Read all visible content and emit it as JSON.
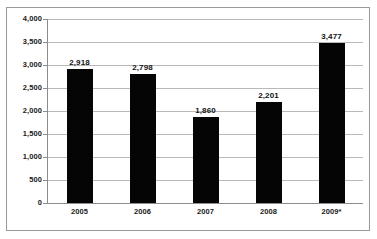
{
  "chart_data": {
    "type": "bar",
    "title": "",
    "subtitle": "",
    "xlabel": "",
    "ylabel": "",
    "categories": [
      "2005",
      "2006",
      "2007",
      "2008",
      "2009*"
    ],
    "values": [
      2918,
      2798,
      1860,
      2201,
      3477
    ],
    "data_labels": [
      "2,918",
      "2,798",
      "1,860",
      "2,201",
      "3,477"
    ],
    "ylim": [
      0,
      4000
    ],
    "y_tick_values": [
      4000,
      3500,
      3000,
      2500,
      2000,
      1500,
      1000,
      500,
      0
    ],
    "y_tick_labels": [
      "4,000",
      "3,500",
      "3,000",
      "2,500",
      "2,000",
      "1,500",
      "1,000",
      "500",
      "0"
    ],
    "grid": true,
    "legend": false,
    "legend_position": "none",
    "series": [
      {
        "name": "",
        "values": [
          2918,
          2798,
          1860,
          2201,
          3477
        ],
        "color": "#050505"
      }
    ],
    "annotations": [
      "2009*"
    ]
  },
  "style": {
    "bar_color": "#050505",
    "gridline_color": "#b9b9b9",
    "axis_color": "#8c8c8c",
    "frame_color": "#9a9a9a",
    "text_color": "#1a1a1a",
    "background": "#ffffff"
  }
}
